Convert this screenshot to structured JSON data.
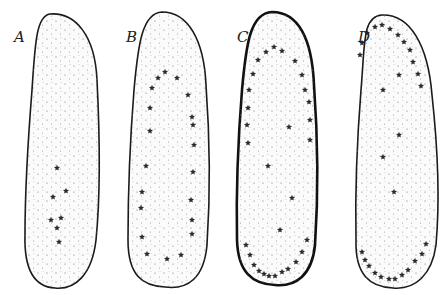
{
  "figure": {
    "panels": [
      {
        "label": "A",
        "label_pos": [
          14,
          42
        ],
        "outline": "M 50 14 C 75 12 95 35 97 80 C 100 140 100 200 96 240 C 92 275 75 290 55 288 C 35 287 24 270 25 235 C 25 190 28 140 32 90 C 35 45 36 16 50 14 Z",
        "stars": [
          [
            57,
            168
          ],
          [
            66,
            191
          ],
          [
            53,
            197
          ],
          [
            61,
            218
          ],
          [
            51,
            220
          ],
          [
            57,
            228
          ],
          [
            59,
            242
          ]
        ]
      },
      {
        "label": "B",
        "label_pos": [
          126,
          42
        ],
        "outline": "M 162 12 C 188 12 204 40 206 85 C 210 140 210 200 207 245 C 204 278 188 290 165 287 C 142 286 128 275 128 240 C 128 190 130 140 134 90 C 138 45 142 13 162 12 Z",
        "stars": [
          [
            158,
            78
          ],
          [
            165,
            72
          ],
          [
            177,
            78
          ],
          [
            152,
            88
          ],
          [
            188,
            95
          ],
          [
            150,
            108
          ],
          [
            192,
            117
          ],
          [
            193,
            125
          ],
          [
            150,
            131
          ],
          [
            194,
            145
          ],
          [
            146,
            166
          ],
          [
            193,
            172
          ],
          [
            142,
            192
          ],
          [
            191,
            200
          ],
          [
            141,
            208
          ],
          [
            192,
            220
          ],
          [
            142,
            237
          ],
          [
            192,
            234
          ],
          [
            147,
            254
          ],
          [
            167,
            259
          ],
          [
            181,
            255
          ]
        ]
      },
      {
        "label": "C",
        "label_pos": [
          237,
          42
        ],
        "thick": true,
        "outline": "M 272 12 C 298 12 312 38 314 85 C 318 140 318 200 315 245 C 312 275 296 287 275 285 C 252 284 238 272 237 240 C 236 190 238 140 242 90 C 246 45 250 13 272 12 Z",
        "stars": [
          [
            258,
            60
          ],
          [
            266,
            52
          ],
          [
            274,
            47
          ],
          [
            282,
            51
          ],
          [
            295,
            61
          ],
          [
            302,
            75
          ],
          [
            253,
            74
          ],
          [
            249,
            90
          ],
          [
            305,
            90
          ],
          [
            248,
            108
          ],
          [
            309,
            102
          ],
          [
            247,
            125
          ],
          [
            310,
            120
          ],
          [
            248,
            143
          ],
          [
            310,
            140
          ],
          [
            289,
            127
          ],
          [
            268,
            166
          ],
          [
            292,
            198
          ],
          [
            280,
            230
          ],
          [
            246,
            245
          ],
          [
            250,
            255
          ],
          [
            254,
            265
          ],
          [
            259,
            271
          ],
          [
            264,
            274
          ],
          [
            269,
            276
          ],
          [
            275,
            276
          ],
          [
            282,
            272
          ],
          [
            288,
            269
          ],
          [
            296,
            262
          ],
          [
            302,
            252
          ],
          [
            307,
            240
          ]
        ]
      },
      {
        "label": "D",
        "label_pos": [
          358,
          42
        ],
        "outline": "M 382 15 C 410 14 428 45 432 95 C 438 150 440 200 436 245 C 432 275 415 290 393 288 C 370 287 355 275 356 240 C 355 190 357 140 361 90 C 365 45 362 16 382 15 Z",
        "stars": [
          [
            367,
            33
          ],
          [
            375,
            27
          ],
          [
            382,
            25
          ],
          [
            390,
            29
          ],
          [
            398,
            35
          ],
          [
            404,
            42
          ],
          [
            362,
            43
          ],
          [
            410,
            50
          ],
          [
            413,
            62
          ],
          [
            418,
            74
          ],
          [
            421,
            86
          ],
          [
            360,
            55
          ],
          [
            399,
            75
          ],
          [
            383,
            90
          ],
          [
            399,
            135
          ],
          [
            383,
            157
          ],
          [
            394,
            192
          ],
          [
            362,
            252
          ],
          [
            365,
            260
          ],
          [
            369,
            266
          ],
          [
            375,
            273
          ],
          [
            381,
            277
          ],
          [
            389,
            279
          ],
          [
            395,
            279
          ],
          [
            402,
            275
          ],
          [
            408,
            270
          ],
          [
            415,
            261
          ],
          [
            422,
            254
          ],
          [
            426,
            244
          ]
        ]
      }
    ]
  }
}
